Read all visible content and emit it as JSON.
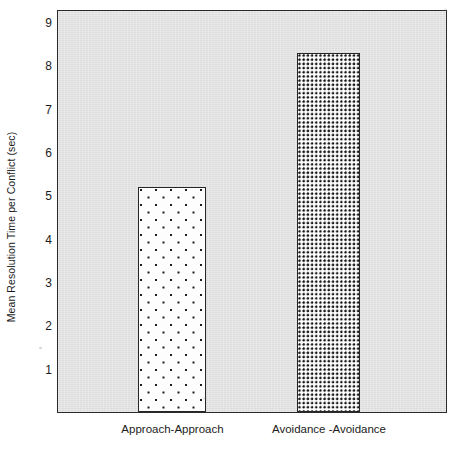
{
  "chart_data": {
    "type": "bar",
    "title": "",
    "xlabel": "",
    "ylabel": "Mean Resolution Time per Conflict (sec)",
    "categories": [
      "Approach-Approach",
      "Avoidance -Avoidance"
    ],
    "values": [
      5.2,
      8.3
    ],
    "ylim": [
      0,
      9.3
    ],
    "yticks": [
      1,
      2,
      3,
      4,
      5,
      6,
      7,
      8,
      9
    ],
    "ytick_labels": [
      "1",
      "2",
      "3",
      "4",
      "5",
      "6",
      "7",
      "8",
      "9"
    ],
    "grid": false,
    "legend": null,
    "legend_position": "none",
    "series": [
      {
        "name": "Mean Resolution Time per Conflict (sec)",
        "values": [
          5.2,
          8.3
        ],
        "fills": [
          "sparse-dot-hatch",
          "dense-dot-hatch"
        ]
      }
    ],
    "annotations": []
  },
  "axes": {
    "y_title": "Mean Resolution Time per Conflict (sec)",
    "y_ticks": [
      {
        "label": "9",
        "value": 9
      },
      {
        "label": "8",
        "value": 8
      },
      {
        "label": "7",
        "value": 7
      },
      {
        "label": "6",
        "value": 6
      },
      {
        "label": "5",
        "value": 5
      },
      {
        "label": "4",
        "value": 4
      },
      {
        "label": "3",
        "value": 3
      },
      {
        "label": "2",
        "value": 2
      },
      {
        "label": "1",
        "value": 1
      }
    ]
  },
  "bars": [
    {
      "category": "Approach-Approach",
      "value": 5.2,
      "pattern": "sparse"
    },
    {
      "category": "Avoidance -Avoidance",
      "value": 8.3,
      "pattern": "dense"
    }
  ],
  "colors": {
    "plot_background": "#e1e1e1",
    "page_background": "#ffffff",
    "axis_line": "#2a2a2a",
    "bar_fill": "#fdfdfd",
    "bar_dot": "#1d1d1d",
    "text": "#1c1c1c"
  }
}
